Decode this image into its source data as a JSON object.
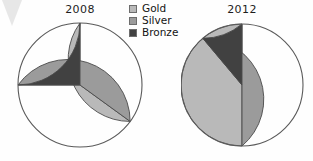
{
  "figure": {
    "background_color": "#fefefe",
    "corner_artifact": "scan-artifact-chevron"
  },
  "legend": {
    "position": "top-center",
    "items": [
      {
        "label": "Gold",
        "color": "#b9b9b9",
        "swatch_name": "legend-swatch-gold"
      },
      {
        "label": "Silver",
        "color": "#9b9b9b",
        "swatch_name": "legend-swatch-silver"
      },
      {
        "label": "Bronze",
        "color": "#414141",
        "swatch_name": "legend-swatch-bronze"
      }
    ]
  },
  "chart_data": [
    {
      "type": "pie",
      "title": "2008",
      "labels": [
        "Gold",
        "Silver",
        "Bronze"
      ],
      "values": [
        35,
        40,
        25
      ],
      "unit": "percent",
      "colors": [
        "#b9b9b9",
        "#9b9b9b",
        "#414141"
      ],
      "start_angle": 90,
      "direction": "clockwise",
      "slice_angles_deg": [
        126,
        144,
        90
      ],
      "legend": "shared",
      "grid": false
    },
    {
      "type": "pie",
      "title": "2012",
      "labels": [
        "Gold",
        "Silver",
        "Bronze"
      ],
      "values": [
        50,
        39,
        11
      ],
      "unit": "percent",
      "colors": [
        "#b9b9b9",
        "#9b9b9b",
        "#414141"
      ],
      "start_angle": 90,
      "direction": "clockwise",
      "slice_angles_deg": [
        180,
        140,
        40
      ],
      "legend": "shared",
      "grid": false
    }
  ]
}
